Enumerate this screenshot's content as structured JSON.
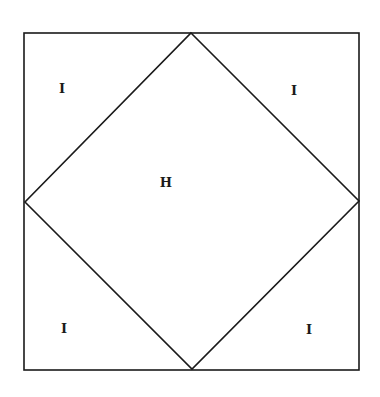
{
  "diagram": {
    "regions": [
      {
        "id": "top-left",
        "label": "I",
        "x": 62,
        "y": 88
      },
      {
        "id": "top-right",
        "label": "I",
        "x": 294,
        "y": 90
      },
      {
        "id": "center",
        "label": "H",
        "x": 166,
        "y": 182
      },
      {
        "id": "bottom-left",
        "label": "I",
        "x": 64,
        "y": 328
      },
      {
        "id": "bottom-right",
        "label": "I",
        "x": 309,
        "y": 329
      }
    ],
    "stroke_color": "#1a1a1a"
  }
}
